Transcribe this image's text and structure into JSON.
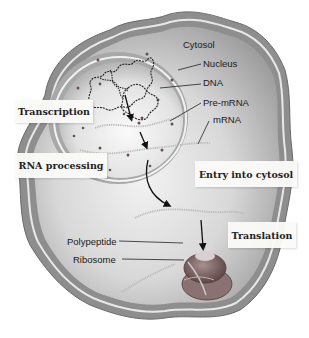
{
  "diagram": {
    "type": "cell-gene-expression",
    "structure_labels": {
      "cytosol": "Cytosol",
      "nucleus": "Nucleus",
      "dna": "DNA",
      "pre_mrna": "Pre-mRNA",
      "mrna": "mRNA",
      "polypeptide": "Polypeptide",
      "ribosome": "Ribosome"
    },
    "process_steps": [
      {
        "label": "Transcription"
      },
      {
        "label": "RNA processing"
      },
      {
        "label": "Entry into cytosol"
      },
      {
        "label": "Translation"
      }
    ],
    "colors": {
      "cell_membrane": "#9a9a9a",
      "cytosol": "#cfcfcf",
      "nucleus": "#e6e6e6",
      "ribosome": "#7a5a5a",
      "arrow": "#111111"
    }
  }
}
